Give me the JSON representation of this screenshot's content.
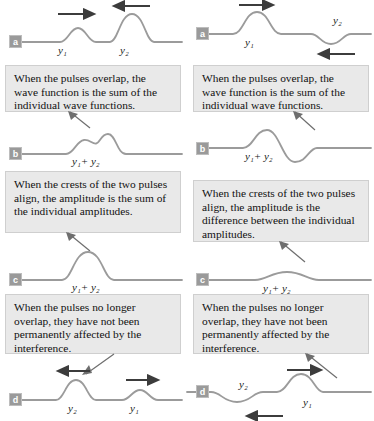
{
  "figure": {
    "columns": [
      {
        "id": "left",
        "interference_type": "constructive",
        "panels": [
          {
            "letter": "a",
            "labels": [
              "y1",
              "y2"
            ],
            "label_text": [
              "y₁",
              "y₂"
            ],
            "arrows": [
              {
                "direction": "right",
                "near": "y1"
              },
              {
                "direction": "left",
                "near": "y2"
              }
            ],
            "pulses": [
              {
                "name": "y1",
                "polarity": "up",
                "amplitude": "small"
              },
              {
                "name": "y2",
                "polarity": "up",
                "amplitude": "large"
              }
            ]
          },
          {
            "letter": "b",
            "labels": [
              "y1+y2"
            ],
            "label_text": [
              "y₁+ y₂"
            ],
            "arrows": [],
            "pulses": [
              {
                "name": "y1+y2",
                "polarity": "up",
                "amplitude": "double-crest"
              }
            ]
          },
          {
            "letter": "c",
            "labels": [
              "y1+y2"
            ],
            "label_text": [
              "y₁+ y₂"
            ],
            "arrows": [],
            "pulses": [
              {
                "name": "y1+y2",
                "polarity": "up",
                "amplitude": "large-merged"
              }
            ]
          },
          {
            "letter": "d",
            "labels": [
              "y2",
              "y1"
            ],
            "label_text": [
              "y₂",
              "y₁"
            ],
            "arrows": [
              {
                "direction": "left",
                "near": "y2"
              },
              {
                "direction": "right",
                "near": "y1"
              }
            ],
            "pulses": [
              {
                "name": "y2",
                "polarity": "up",
                "amplitude": "large"
              },
              {
                "name": "y1",
                "polarity": "up",
                "amplitude": "small"
              }
            ]
          }
        ],
        "callouts": [
          "When the pulses overlap, the wave function is the sum of the individual wave functions.",
          "When the crests of the two pulses align, the amplitude is the sum of the individual amplitudes.",
          "When the pulses no longer overlap, they have not been permanently affected by the interference."
        ]
      },
      {
        "id": "right",
        "interference_type": "destructive",
        "panels": [
          {
            "letter": "a",
            "labels": [
              "y1",
              "y2"
            ],
            "label_text": [
              "y₁",
              "y₂"
            ],
            "arrows": [
              {
                "direction": "right",
                "near": "y1"
              },
              {
                "direction": "left",
                "near": "y2"
              }
            ],
            "pulses": [
              {
                "name": "y1",
                "polarity": "up",
                "amplitude": "large"
              },
              {
                "name": "y2",
                "polarity": "down",
                "amplitude": "small"
              }
            ]
          },
          {
            "letter": "b",
            "labels": [
              "y1+y2"
            ],
            "label_text": [
              "y₁+ y₂"
            ],
            "arrows": [],
            "pulses": [
              {
                "name": "y1+y2",
                "polarity": "crest-then-trough",
                "amplitude": "medium"
              }
            ]
          },
          {
            "letter": "c",
            "labels": [
              "y1+y2"
            ],
            "label_text": [
              "y₁+ y₂"
            ],
            "arrows": [],
            "pulses": [
              {
                "name": "y1+y2",
                "polarity": "up",
                "amplitude": "very-small"
              }
            ]
          },
          {
            "letter": "d",
            "labels": [
              "y2",
              "y1"
            ],
            "label_text": [
              "y₂",
              "y₁"
            ],
            "arrows": [
              {
                "direction": "left",
                "near": "y2"
              },
              {
                "direction": "right",
                "near": "y1"
              }
            ],
            "pulses": [
              {
                "name": "y2",
                "polarity": "down",
                "amplitude": "small"
              },
              {
                "name": "y1",
                "polarity": "up",
                "amplitude": "large"
              }
            ]
          }
        ],
        "callouts": [
          "When the pulses overlap, the wave function is the sum of the individual wave functions.",
          "When the crests of the two pulses align, the amplitude is the difference between the individual amplitudes.",
          "When the pulses no longer overlap, they have not been permanently affected by the interference."
        ]
      }
    ],
    "colors": {
      "wave_stroke": "#9b9b9b",
      "arrow": "#3c3c3c",
      "callout_background": "#e9e9e9",
      "callout_border": "#cfcfcf",
      "badge_background": "#9a9a9a",
      "badge_text": "#ffffff",
      "page_background": "#ffffff"
    }
  }
}
